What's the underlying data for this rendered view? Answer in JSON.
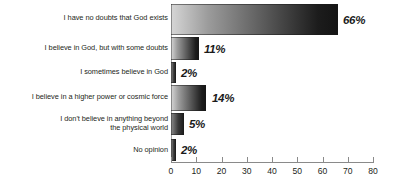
{
  "chart_data": {
    "type": "bar",
    "orientation": "horizontal",
    "title": "",
    "subtitle": "",
    "xlabel": "",
    "ylabel": "",
    "xlim": [
      0,
      80
    ],
    "xticks": [
      0,
      10,
      20,
      30,
      40,
      50,
      60,
      70,
      80
    ],
    "xtick_labels": [
      "0",
      "10",
      "20",
      "30",
      "40",
      "50",
      "60",
      "70",
      "80"
    ],
    "grid": false,
    "legend": null,
    "categories": [
      "I have no doubts that God exists",
      "I believe in God, but with some doubts",
      "I sometimes believe in God",
      "I believe in a higher power or cosmic force",
      "I don't believe in anything beyond\nthe physical world",
      "No opinion"
    ],
    "values": [
      66,
      11,
      2,
      14,
      5,
      2
    ],
    "value_labels": [
      "66%",
      "11%",
      "2%",
      "14%",
      "5%",
      "2%"
    ],
    "colors": {
      "bar_gradient_start": "#d6d6d6",
      "bar_gradient_end": "#141414",
      "axis": "#8a8a8a",
      "text": "#231f20",
      "background": "#ffffff"
    }
  }
}
